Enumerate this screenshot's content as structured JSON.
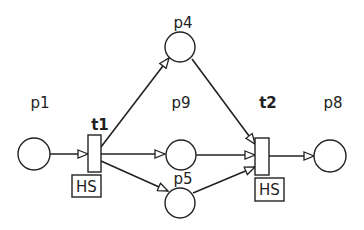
{
  "diagram": {
    "type": "petri-net",
    "colors": {
      "stroke": "#222222",
      "background": "#ffffff"
    },
    "places": [
      {
        "id": "p1",
        "label": "p1"
      },
      {
        "id": "p4",
        "label": "p4"
      },
      {
        "id": "p9",
        "label": "p9"
      },
      {
        "id": "p5",
        "label": "p5"
      },
      {
        "id": "p8",
        "label": "p8"
      }
    ],
    "transitions": [
      {
        "id": "t1",
        "label": "t1",
        "annotation": "HS"
      },
      {
        "id": "t2",
        "label": "t2",
        "annotation": "HS"
      }
    ],
    "arcs": [
      {
        "from": "p1",
        "to": "t1"
      },
      {
        "from": "t1",
        "to": "p4"
      },
      {
        "from": "t1",
        "to": "p9"
      },
      {
        "from": "t1",
        "to": "p5"
      },
      {
        "from": "p4",
        "to": "t2"
      },
      {
        "from": "p9",
        "to": "t2"
      },
      {
        "from": "p5",
        "to": "t2"
      },
      {
        "from": "t2",
        "to": "p8"
      }
    ]
  }
}
